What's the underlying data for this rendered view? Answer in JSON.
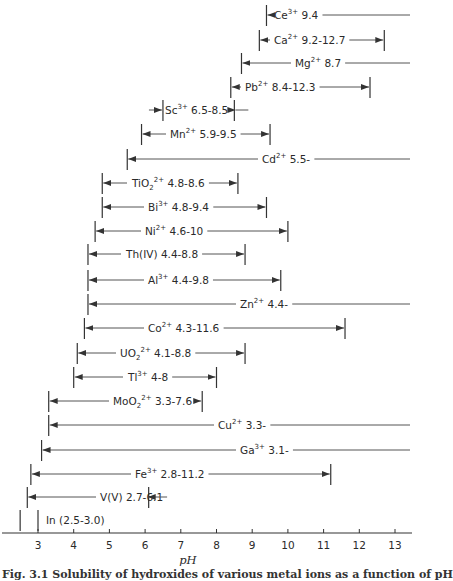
{
  "chart_data": {
    "type": "range-bar",
    "title": "",
    "xlabel": "pH",
    "ylabel": "",
    "xlim": [
      2.4,
      13.4
    ],
    "x_ticks": [
      3,
      4,
      5,
      6,
      7,
      8,
      9,
      10,
      11,
      12,
      13
    ],
    "grid": false,
    "legend": null,
    "series": [
      {
        "ion": "Ce",
        "charge": "3+",
        "label_tail": "9.4",
        "start": 9.4,
        "end": null,
        "open_end": true
      },
      {
        "ion": "Ca",
        "charge": "2+",
        "label_tail": "9.2-12.7",
        "start": 9.2,
        "end": 12.7,
        "open_end": false
      },
      {
        "ion": "Mg",
        "charge": "2+",
        "label_tail": "8.7",
        "start": 8.7,
        "end": null,
        "open_end": true
      },
      {
        "ion": "Pb",
        "charge": "2+",
        "label_tail": "8.4-12.3",
        "start": 8.4,
        "end": 12.3,
        "open_end": false
      },
      {
        "ion": "Sc",
        "charge": "3+",
        "label_tail": "6.5-8.5",
        "start": 6.5,
        "end": 8.5,
        "open_end": false,
        "inward_arrows": true
      },
      {
        "ion": "Mn",
        "charge": "2+",
        "label_tail": "5.9-9.5",
        "start": 5.9,
        "end": 9.5,
        "open_end": false
      },
      {
        "ion": "Cd",
        "charge": "2+",
        "label_tail": "5.5-",
        "start": 5.5,
        "end": null,
        "open_end": true
      },
      {
        "ion": "TiO",
        "sub": "2",
        "charge": "2+",
        "label_tail": "4.8-8.6",
        "start": 4.8,
        "end": 8.6,
        "open_end": false
      },
      {
        "ion": "Bi",
        "charge": "3+",
        "label_tail": "4.8-9.4",
        "start": 4.8,
        "end": 9.4,
        "open_end": false
      },
      {
        "ion": "Ni",
        "charge": "2+",
        "label_tail": "4.6-10",
        "start": 4.6,
        "end": 10.0,
        "open_end": false
      },
      {
        "ion": "Th(IV)",
        "charge": "",
        "label_tail": "4.4-8.8",
        "start": 4.4,
        "end": 8.8,
        "open_end": false
      },
      {
        "ion": "Al",
        "charge": "3+",
        "label_tail": "4.4-9.8",
        "start": 4.4,
        "end": 9.8,
        "open_end": false
      },
      {
        "ion": "Zn",
        "charge": "2+",
        "label_tail": "4.4-",
        "start": 4.4,
        "end": null,
        "open_end": true
      },
      {
        "ion": "Co",
        "charge": "2+",
        "label_tail": "4.3-11.6",
        "start": 4.3,
        "end": 11.6,
        "open_end": false
      },
      {
        "ion": "UO",
        "sub": "2",
        "charge": "2+",
        "label_tail": "4.1-8.8",
        "start": 4.1,
        "end": 8.8,
        "open_end": false
      },
      {
        "ion": "Tl",
        "charge": "3+",
        "label_tail": "4-8",
        "start": 4.0,
        "end": 8.0,
        "open_end": false
      },
      {
        "ion": "MoO",
        "sub": "2",
        "charge": "2+",
        "label_tail": "3.3-7.6",
        "start": 3.3,
        "end": 7.6,
        "open_end": false
      },
      {
        "ion": "Cu",
        "charge": "2+",
        "label_tail": "3.3-",
        "start": 3.3,
        "end": null,
        "open_end": true
      },
      {
        "ion": "Ga",
        "charge": "3+",
        "label_tail": "3.1-",
        "start": 3.1,
        "end": null,
        "open_end": true
      },
      {
        "ion": "Fe",
        "charge": "3+",
        "label_tail": "2.8-11.2",
        "start": 2.8,
        "end": 11.2,
        "open_end": false
      },
      {
        "ion": "V(V)",
        "charge": "",
        "label_tail": "2.7-6.1",
        "start": 2.7,
        "end": 6.1,
        "open_end": false
      },
      {
        "ion": "In",
        "charge": "",
        "label_tail": "(2.5-3.0)",
        "start": 2.5,
        "end": 3.0,
        "open_end": false,
        "boxed": true
      }
    ]
  },
  "layout": {
    "px_per_ph": 35.7,
    "ph3_x": 38,
    "row_ys": [
      15,
      40,
      63,
      87,
      110,
      134,
      159,
      183,
      207,
      231,
      254,
      280,
      304,
      328,
      353,
      377,
      401,
      425,
      450,
      474,
      497,
      520
    ],
    "label_x": [
      274,
      274,
      295,
      245,
      165,
      170,
      262,
      132,
      148,
      145,
      126,
      148,
      240,
      148,
      120,
      128,
      113,
      218,
      240,
      135,
      100,
      46
    ],
    "axis_y": 533,
    "open_end_x": 410,
    "line_color": "#555555"
  },
  "caption": "Fig. 3.1  Solubility of hydroxides of various metal ions as a function of pH"
}
